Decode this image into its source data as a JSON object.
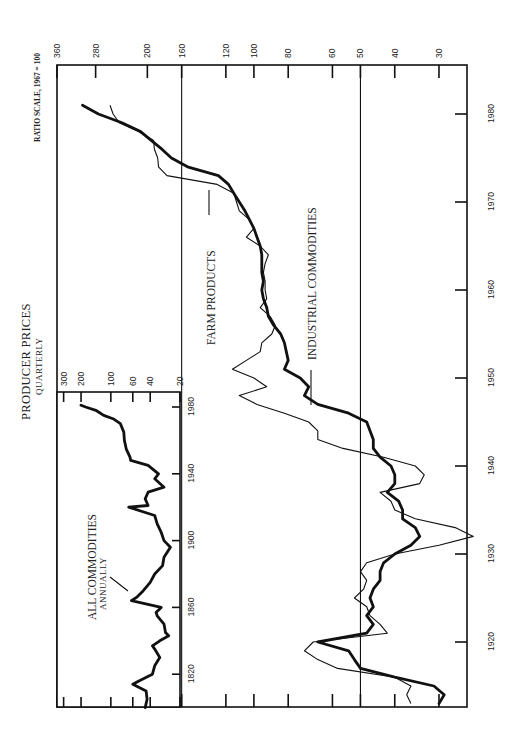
{
  "title": "PRODUCER PRICES",
  "subtitle": "QUARTERLY",
  "scale_note": "RATIO SCALE, 1967 = 100",
  "labels": {
    "farm": "FARM PRODUCTS",
    "industrial": "INDUSTRIAL COMMODITIES",
    "inset_series": "ALL COMMODITIES",
    "inset_sub": "ANNUALLY"
  },
  "chart_data": [
    {
      "type": "line",
      "title": "PRODUCER PRICES — QUARTERLY",
      "ylabel": "RATIO SCALE, 1967 = 100",
      "xlabel": "",
      "yscale": "log",
      "y_ticks": [
        360,
        280,
        200,
        160,
        120,
        100,
        80,
        60,
        50,
        40,
        30
      ],
      "x_ticks": [
        1920,
        1930,
        1940,
        1950,
        1960,
        1970,
        1980
      ],
      "reference_lines": [
        160,
        50
      ],
      "xlim": [
        1913,
        1982
      ],
      "ylim": [
        25,
        360
      ],
      "series": [
        {
          "name": "FARM PRODUCTS",
          "style": "thin",
          "points": [
            [
              1913,
              36
            ],
            [
              1914,
              37
            ],
            [
              1915,
              36
            ],
            [
              1916,
              40
            ],
            [
              1917,
              58
            ],
            [
              1918,
              66
            ],
            [
              1919,
              72
            ],
            [
              1920,
              68
            ],
            [
              1921,
              42
            ],
            [
              1922,
              44
            ],
            [
              1923,
              47
            ],
            [
              1924,
              48
            ],
            [
              1925,
              52
            ],
            [
              1926,
              49
            ],
            [
              1927,
              48
            ],
            [
              1928,
              50
            ],
            [
              1929,
              48
            ],
            [
              1930,
              40
            ],
            [
              1931,
              30
            ],
            [
              1932,
              24
            ],
            [
              1933,
              27
            ],
            [
              1934,
              35
            ],
            [
              1935,
              40
            ],
            [
              1936,
              41
            ],
            [
              1937,
              44
            ],
            [
              1938,
              34
            ],
            [
              1939,
              33
            ],
            [
              1940,
              35
            ],
            [
              1941,
              43
            ],
            [
              1942,
              56
            ],
            [
              1943,
              66
            ],
            [
              1944,
              66
            ],
            [
              1945,
              70
            ],
            [
              1946,
              82
            ],
            [
              1947,
              98
            ],
            [
              1948,
              110
            ],
            [
              1949,
              92
            ],
            [
              1950,
              100
            ],
            [
              1951,
              115
            ],
            [
              1952,
              105
            ],
            [
              1953,
              96
            ],
            [
              1954,
              95
            ],
            [
              1955,
              89
            ],
            [
              1956,
              87
            ],
            [
              1957,
              90
            ],
            [
              1958,
              96
            ],
            [
              1959,
              92
            ],
            [
              1960,
              93
            ],
            [
              1961,
              93
            ],
            [
              1962,
              94
            ],
            [
              1963,
              93
            ],
            [
              1964,
              91
            ],
            [
              1965,
              96
            ],
            [
              1966,
              105
            ],
            [
              1967,
              100
            ],
            [
              1968,
              103
            ],
            [
              1969,
              110
            ],
            [
              1970,
              112
            ],
            [
              1971,
              114
            ],
            [
              1972,
              127
            ],
            [
              1973,
              176
            ],
            [
              1974,
              186
            ],
            [
              1975,
              187
            ],
            [
              1976,
              191
            ],
            [
              1977,
              192
            ],
            [
              1978,
              212
            ],
            [
              1979,
              240
            ],
            [
              1980,
              250
            ],
            [
              1981,
              255
            ]
          ]
        },
        {
          "name": "INDUSTRIAL COMMODITIES",
          "style": "thick",
          "points": [
            [
              1913,
              30
            ],
            [
              1914,
              29
            ],
            [
              1915,
              31
            ],
            [
              1916,
              40
            ],
            [
              1917,
              50
            ],
            [
              1918,
              52
            ],
            [
              1919,
              54
            ],
            [
              1920,
              66
            ],
            [
              1921,
              48
            ],
            [
              1922,
              46
            ],
            [
              1923,
              48
            ],
            [
              1924,
              46
            ],
            [
              1925,
              47
            ],
            [
              1926,
              46
            ],
            [
              1927,
              44
            ],
            [
              1928,
              44
            ],
            [
              1929,
              43
            ],
            [
              1930,
              40
            ],
            [
              1931,
              36
            ],
            [
              1932,
              34
            ],
            [
              1933,
              35
            ],
            [
              1934,
              38
            ],
            [
              1935,
              38
            ],
            [
              1936,
              39
            ],
            [
              1937,
              42
            ],
            [
              1938,
              40
            ],
            [
              1939,
              40
            ],
            [
              1940,
              41
            ],
            [
              1941,
              44
            ],
            [
              1942,
              46
            ],
            [
              1943,
              46
            ],
            [
              1944,
              47
            ],
            [
              1945,
              48
            ],
            [
              1946,
              54
            ],
            [
              1947,
              66
            ],
            [
              1948,
              72
            ],
            [
              1949,
              70
            ],
            [
              1950,
              74
            ],
            [
              1951,
              82
            ],
            [
              1952,
              80
            ],
            [
              1953,
              81
            ],
            [
              1954,
              82
            ],
            [
              1955,
              84
            ],
            [
              1956,
              88
            ],
            [
              1957,
              91
            ],
            [
              1958,
              92
            ],
            [
              1959,
              94
            ],
            [
              1960,
              95
            ],
            [
              1961,
              94
            ],
            [
              1962,
              95
            ],
            [
              1963,
              95
            ],
            [
              1964,
              95
            ],
            [
              1965,
              96
            ],
            [
              1966,
              98
            ],
            [
              1967,
              100
            ],
            [
              1968,
              103
            ],
            [
              1969,
              106
            ],
            [
              1970,
              110
            ],
            [
              1971,
              114
            ],
            [
              1972,
              118
            ],
            [
              1973,
              126
            ],
            [
              1974,
              154
            ],
            [
              1975,
              171
            ],
            [
              1976,
              182
            ],
            [
              1977,
              195
            ],
            [
              1978,
              209
            ],
            [
              1979,
              236
            ],
            [
              1980,
              275
            ],
            [
              1981,
              305
            ]
          ]
        }
      ]
    },
    {
      "type": "line",
      "title": "ALL COMMODITIES — ANNUALLY",
      "yscale": "log",
      "y_ticks": [
        300,
        200,
        100,
        60,
        40,
        20
      ],
      "x_ticks": [
        1820,
        1860,
        1900,
        1940,
        1980
      ],
      "xlim": [
        1800,
        1981
      ],
      "ylim": [
        20,
        350
      ],
      "series": [
        {
          "name": "ALL COMMODITIES",
          "style": "thick",
          "points": [
            [
              1800,
              45
            ],
            [
              1805,
              43
            ],
            [
              1810,
              44
            ],
            [
              1814,
              60
            ],
            [
              1816,
              52
            ],
            [
              1820,
              38
            ],
            [
              1825,
              36
            ],
            [
              1830,
              32
            ],
            [
              1835,
              36
            ],
            [
              1837,
              38
            ],
            [
              1840,
              32
            ],
            [
              1843,
              26
            ],
            [
              1845,
              28
            ],
            [
              1850,
              29
            ],
            [
              1855,
              34
            ],
            [
              1857,
              35
            ],
            [
              1860,
              31
            ],
            [
              1864,
              62
            ],
            [
              1866,
              55
            ],
            [
              1870,
              47
            ],
            [
              1875,
              40
            ],
            [
              1880,
              36
            ],
            [
              1885,
              30
            ],
            [
              1890,
              29
            ],
            [
              1896,
              25
            ],
            [
              1900,
              29
            ],
            [
              1905,
              31
            ],
            [
              1910,
              34
            ],
            [
              1915,
              36
            ],
            [
              1920,
              66
            ],
            [
              1921,
              42
            ],
            [
              1925,
              45
            ],
            [
              1929,
              42
            ],
            [
              1932,
              29
            ],
            [
              1937,
              36
            ],
            [
              1940,
              33
            ],
            [
              1945,
              42
            ],
            [
              1948,
              63
            ],
            [
              1950,
              64
            ],
            [
              1955,
              70
            ],
            [
              1960,
              73
            ],
            [
              1965,
              74
            ],
            [
              1970,
              80
            ],
            [
              1973,
              95
            ],
            [
              1975,
              118
            ],
            [
              1978,
              142
            ],
            [
              1980,
              180
            ],
            [
              1981,
              200
            ]
          ]
        }
      ]
    }
  ]
}
